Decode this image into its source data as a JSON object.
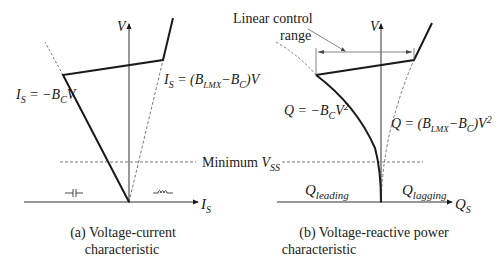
{
  "figure": {
    "panel_a": {
      "caption_line1": "(a) Voltage-current",
      "caption_line2": "characteristic",
      "y_axis_label": "V",
      "x_axis_label_main": "I",
      "x_axis_label_sub": "S",
      "eq_left": {
        "p1": "I",
        "p1sub": "S",
        "p2": " = −B",
        "p2sub": "C",
        "p3": "V"
      },
      "eq_right": {
        "p1": "I",
        "p1sub": "S",
        "p2": " = (B",
        "p2sub": "LMX",
        "p3": "−B",
        "p3sub": "C",
        "p4": ")V"
      },
      "capacitor_symbol": "capacitor",
      "inductor_symbol": "inductor"
    },
    "panel_b": {
      "caption_line1": "(b) Voltage-reactive  power",
      "caption_line2": "characteristic",
      "y_axis_label": "V",
      "x_axis_label_main": "Q",
      "x_axis_label_sub": "S",
      "eq_left": {
        "p1": "Q = −B",
        "p1sub": "C",
        "p2": "V",
        "p2sup": "2"
      },
      "eq_right": {
        "p1": "Q = (B",
        "p1sub": "LMX",
        "p2": "−B",
        "p2sub": "C",
        "p3": ")V",
        "p3sup": "2"
      },
      "leading_label": {
        "main": "Q",
        "sub": "leading"
      },
      "lagging_label": {
        "main": "Q",
        "sub": "lagging"
      },
      "annotation_line1": "Linear control",
      "annotation_line2": "range"
    },
    "shared": {
      "min_label_text": "Minimum ",
      "min_label_var": "V",
      "min_label_sub": "SS"
    },
    "colors": {
      "line": "#1a1a1a",
      "dashed": "#555555",
      "bracket": "#666666"
    }
  }
}
